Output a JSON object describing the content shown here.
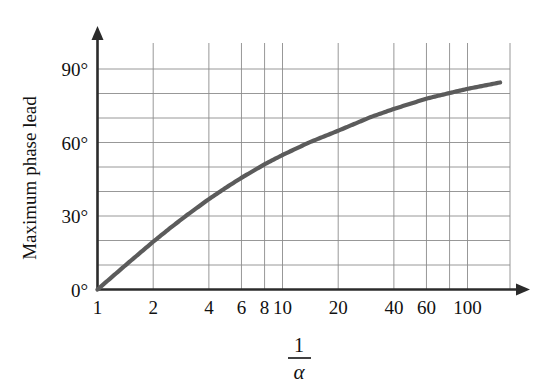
{
  "figure": {
    "y_axis_title": "Maximum phase lead",
    "x_axis_title_numerator": "1",
    "x_axis_title_denominator": "α",
    "x_axis_title_plain": "1/α"
  },
  "chart_data": {
    "type": "line",
    "title": "",
    "subtitle": "",
    "xlabel": "1/α",
    "ylabel": "Maximum phase lead",
    "xscale": "log",
    "yscale": "linear",
    "xlim": [
      1,
      150
    ],
    "ylim": [
      0,
      100
    ],
    "grid": true,
    "legend": null,
    "x_tick_labels": [
      "1",
      "2",
      "4",
      "6",
      "8",
      "10",
      "20",
      "40",
      "60",
      "100"
    ],
    "x_tick_values": [
      1,
      2,
      4,
      6,
      8,
      10,
      20,
      40,
      60,
      100
    ],
    "x_gridline_values": [
      2,
      4,
      6,
      8,
      10,
      20,
      40,
      60,
      80,
      100
    ],
    "y_tick_labels": [
      "0°",
      "30°",
      "60°",
      "90°"
    ],
    "y_tick_values": [
      0,
      30,
      60,
      90
    ],
    "y_gridline_values": [
      10,
      20,
      30,
      40,
      50,
      60,
      70,
      80,
      90
    ],
    "series": [
      {
        "name": "Maximum phase lead",
        "color": "#5b5b5b",
        "formula": "phi_max = arcsin((1/alpha - 1)/(1/alpha + 1))",
        "x": [
          1,
          1.2,
          1.5,
          2,
          2.5,
          3,
          4,
          5,
          6,
          8,
          10,
          14,
          20,
          30,
          40,
          60,
          80,
          100,
          150
        ],
        "values": [
          0,
          5.2,
          11.5,
          19.5,
          25.4,
          30,
          36.9,
          41.8,
          45.6,
          51.1,
          54.9,
          60.1,
          64.8,
          70.4,
          73.7,
          77.9,
          80.2,
          81.9,
          84.5
        ]
      }
    ],
    "axis_arrows": [
      "x-right",
      "y-up"
    ]
  }
}
